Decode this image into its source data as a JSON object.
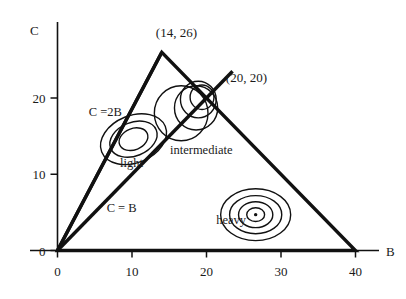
{
  "chart_data": {
    "type": "scatter",
    "title": "",
    "xlabel": "B",
    "ylabel": "C",
    "xlim": [
      0,
      42
    ],
    "ylim": [
      0,
      29
    ],
    "grid": false,
    "legend_position": "none",
    "x_ticks": [
      {
        "value": 0,
        "label": "0"
      },
      {
        "value": 10,
        "label": "10"
      },
      {
        "value": 20,
        "label": "20"
      },
      {
        "value": 30,
        "label": "30"
      },
      {
        "value": 40,
        "label": "40"
      }
    ],
    "y_ticks": [
      {
        "value": 0,
        "label": "0"
      },
      {
        "value": 10,
        "label": "10"
      },
      {
        "value": 20,
        "label": "20"
      }
    ],
    "region_polygon": {
      "name": "feasible-triangle",
      "vertices": [
        [
          0,
          0
        ],
        [
          14,
          26
        ],
        [
          40,
          0
        ]
      ]
    },
    "boundary_lines": [
      {
        "name": "C = 2B",
        "label": "C =2B",
        "from": [
          0,
          0
        ],
        "to": [
          14,
          26
        ],
        "label_at": [
          4.2,
          17.6
        ]
      },
      {
        "name": "C = B",
        "label": "C = B",
        "from": [
          0,
          0
        ],
        "to": [
          23.5,
          23.5
        ],
        "label_at": [
          6.6,
          5.1
        ]
      }
    ],
    "annotated_points": [
      {
        "label": "(14, 26)",
        "x": 14,
        "y": 26,
        "label_at": [
          13.2,
          28.0
        ]
      },
      {
        "label": "(20, 20)",
        "x": 20,
        "y": 20,
        "label_at": [
          22.6,
          22.1
        ]
      }
    ],
    "series": [
      {
        "name": "light",
        "label": "light",
        "label_at": [
          8.4,
          11.0
        ],
        "center": [
          10.2,
          14.6
        ],
        "contours": [
          {
            "rx": 4.6,
            "ry": 3.1,
            "rotate": -22
          },
          {
            "rx": 3.3,
            "ry": 2.2,
            "rotate": -22
          },
          {
            "rx": 2.0,
            "ry": 1.4,
            "rotate": -22
          }
        ]
      },
      {
        "name": "intermediate",
        "label": "intermediate",
        "label_at": [
          15.1,
          12.6
        ],
        "center": [
          17.8,
          18.6
        ],
        "contours": [
          {
            "rx": 3.6,
            "ry": 3.6,
            "rotate": 0,
            "cx": 16.6,
            "cy": 18.0
          },
          {
            "rx": 2.9,
            "ry": 2.9,
            "rotate": 0,
            "cx": 18.6,
            "cy": 18.7
          },
          {
            "rx": 2.4,
            "ry": 2.4,
            "rotate": 0,
            "cx": 18.9,
            "cy": 19.8
          },
          {
            "rx": 1.6,
            "ry": 1.6,
            "rotate": 0,
            "cx": 19.4,
            "cy": 20.1
          }
        ]
      },
      {
        "name": "heavy",
        "label": "heavy",
        "label_at": [
          21.3,
          3.5
        ],
        "center": [
          26.6,
          4.7
        ],
        "contours": [
          {
            "rx": 4.7,
            "ry": 3.4,
            "rotate": 0
          },
          {
            "rx": 3.5,
            "ry": 2.5,
            "rotate": 0
          },
          {
            "rx": 2.3,
            "ry": 1.7,
            "rotate": 0
          },
          {
            "rx": 1.2,
            "ry": 0.9,
            "rotate": 0
          }
        ],
        "center_marker": true
      }
    ],
    "colors": {
      "ink": "#111111",
      "background": "#ffffff",
      "axis": "#2a2a2a"
    }
  }
}
